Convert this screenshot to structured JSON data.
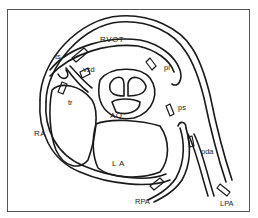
{
  "diagram": {
    "type": "anatomical-schematic",
    "chambers": [
      {
        "id": "rvot",
        "label": "RVOT"
      },
      {
        "id": "ra",
        "label": "RA"
      },
      {
        "id": "la",
        "label": "L A"
      },
      {
        "id": "ao",
        "label": "AO"
      }
    ],
    "vessels": [
      {
        "id": "rpa",
        "label": "RPA"
      },
      {
        "id": "lpa",
        "label": "LPA"
      }
    ],
    "probe_markers": [
      {
        "id": "ts",
        "label": "ts"
      },
      {
        "id": "vsd",
        "label": "vsd"
      },
      {
        "id": "tr",
        "label": "tr"
      },
      {
        "id": "pi",
        "label": "pi"
      },
      {
        "id": "ps",
        "label": "ps"
      },
      {
        "id": "pda",
        "label": "pda"
      },
      {
        "id": "rpa_probe",
        "label": "RPA"
      },
      {
        "id": "lpa_probe",
        "label": "LPA"
      }
    ],
    "colors": {
      "line": "#1a1a1a",
      "background": "#ffffff",
      "frame": "#555555"
    }
  }
}
